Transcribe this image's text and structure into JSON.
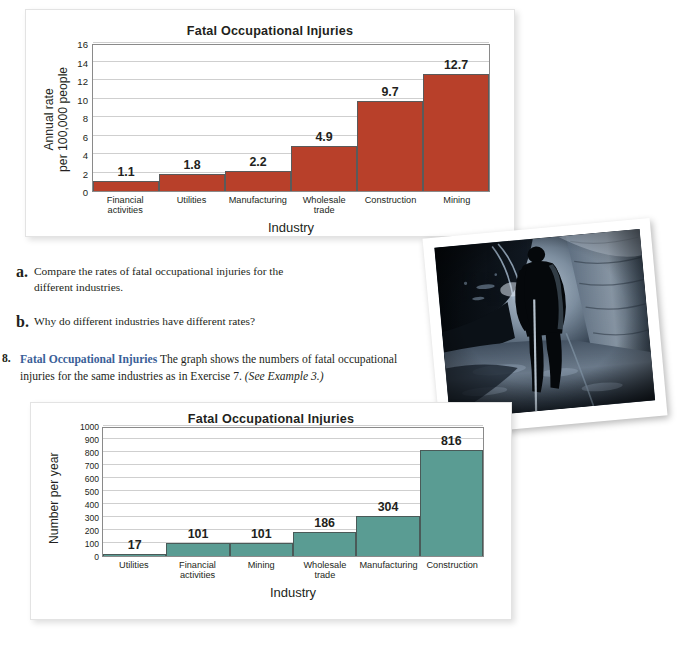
{
  "page": {
    "background_color": "#ffffff"
  },
  "chart_data": [
    {
      "id": "rate-chart",
      "type": "bar",
      "title": "Fatal Occupational Injuries",
      "xlabel": "Industry",
      "ylabel": "Annual rate\nper 100,000 people",
      "ylabel_line1": "Annual rate",
      "ylabel_line2": "per 100,000 people",
      "categories": [
        "Financial activities",
        "Utilities",
        "Manufacturing",
        "Wholesale trade",
        "Construction",
        "Mining"
      ],
      "category_lines": [
        [
          "Financial",
          "activities"
        ],
        [
          "Utilities"
        ],
        [
          "Manufacturing"
        ],
        [
          "Wholesale",
          "trade"
        ],
        [
          "Construction"
        ],
        [
          "Mining"
        ]
      ],
      "values": [
        1.1,
        1.8,
        2.2,
        4.9,
        9.7,
        12.7
      ],
      "value_labels": [
        "1.1",
        "1.8",
        "2.2",
        "4.9",
        "9.7",
        "12.7"
      ],
      "yticks": [
        0,
        2,
        4,
        6,
        8,
        10,
        12,
        14,
        16
      ],
      "ytick_labels": [
        "0",
        "2",
        "4",
        "6",
        "8",
        "10",
        "12",
        "14",
        "16"
      ],
      "ylim": [
        0,
        16
      ],
      "grid": true,
      "legend": "none",
      "bar_color": "#b8402a",
      "bar_border_color": "#5a5a5a"
    },
    {
      "id": "count-chart",
      "type": "bar",
      "title": "Fatal Occupational Injuries",
      "xlabel": "Industry",
      "ylabel": "Number per year",
      "categories": [
        "Utilities",
        "Financial activities",
        "Mining",
        "Wholesale trade",
        "Manufacturing",
        "Construction"
      ],
      "category_lines": [
        [
          "Utilities"
        ],
        [
          "Financial",
          "activities"
        ],
        [
          "Mining"
        ],
        [
          "Wholesale",
          "trade"
        ],
        [
          "Manufacturing"
        ],
        [
          "Construction"
        ]
      ],
      "values": [
        17,
        101,
        101,
        186,
        304,
        816
      ],
      "value_labels": [
        "17",
        "101",
        "101",
        "186",
        "304",
        "816"
      ],
      "yticks": [
        0,
        100,
        200,
        300,
        400,
        500,
        600,
        700,
        800,
        900,
        1000
      ],
      "ytick_labels": [
        "0",
        "100",
        "200",
        "300",
        "400",
        "500",
        "600",
        "700",
        "800",
        "900",
        "1000"
      ],
      "ylim": [
        0,
        1000
      ],
      "grid": true,
      "legend": "none",
      "bar_color": "#5a9c93",
      "bar_border_color": "#4a5a58"
    }
  ],
  "exercise7_parts": {
    "part_a": {
      "marker": "a.",
      "text": "Compare the rates of fatal occupational injuries for the different industries."
    },
    "part_b": {
      "marker": "b.",
      "text": "Why do different industries have different rates?"
    }
  },
  "exercise8": {
    "number": "8.",
    "heading": "Fatal Occupational Injuries",
    "body": "The graph shows the numbers of fatal occupational injuries for the same industries as in Exercise 7.",
    "reference": "(See Example 3.)"
  },
  "photo": {
    "caption": "",
    "alt_description": "Silhouette of a miner walking through a dark underground mine tunnel"
  },
  "colors": {
    "red_bar": "#b8402a",
    "teal_bar": "#5a9c93",
    "heading_blue": "#3a6098",
    "gridline": "#cfcfcf",
    "axis": "#8a8a8a"
  }
}
